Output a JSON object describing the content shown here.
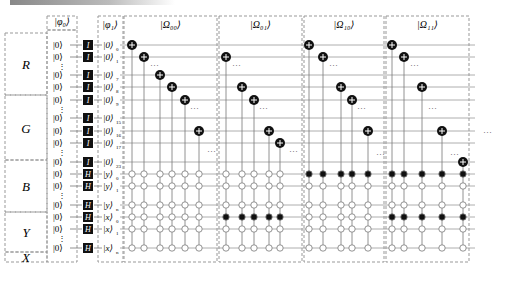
{
  "registers": [
    {
      "name": "R",
      "y0": 33,
      "y1": 95
    },
    {
      "name": "G",
      "y0": 95,
      "y1": 160
    },
    {
      "name": "B",
      "y0": 160,
      "y1": 212
    },
    {
      "name": "Y",
      "y0": 212,
      "y1": 252
    },
    {
      "name": "X",
      "y0": 252,
      "y1": 297
    }
  ],
  "input_header": "|φ₀⟩",
  "output_header": "|φ₁⟩",
  "rows": [
    {
      "id": "r0",
      "y": 45,
      "in": "|0⟩",
      "gate": "I",
      "out": "|0⟩",
      "sub": "0"
    },
    {
      "id": "r1",
      "y": 57,
      "in": "|0⟩",
      "gate": "I",
      "out": "|0⟩",
      "sub": "1"
    },
    {
      "id": "r7",
      "y": 75,
      "in": "|0⟩",
      "gate": "I",
      "out": "|0⟩",
      "sub": "7"
    },
    {
      "id": "r8",
      "y": 87,
      "in": "|0⟩",
      "gate": "I",
      "out": "|0⟩",
      "sub": "8"
    },
    {
      "id": "r9",
      "y": 100,
      "in": "|0⟩",
      "gate": "I",
      "out": "|0⟩",
      "sub": "9"
    },
    {
      "id": "r15",
      "y": 118,
      "in": "|0⟩",
      "gate": "I",
      "out": "|0⟩",
      "sub": "15"
    },
    {
      "id": "r16",
      "y": 131,
      "in": "|0⟩",
      "gate": "I",
      "out": "|0⟩",
      "sub": "16"
    },
    {
      "id": "r17",
      "y": 143,
      "in": "|0⟩",
      "gate": "I",
      "out": "|0⟩",
      "sub": "17"
    },
    {
      "id": "r23",
      "y": 162,
      "in": "|0⟩",
      "gate": "I",
      "out": "|0⟩",
      "sub": "23"
    },
    {
      "id": "y0",
      "y": 174,
      "in": "|0⟩",
      "gate": "H",
      "out": "|y⟩",
      "sub": "0"
    },
    {
      "id": "y1",
      "y": 186,
      "in": "|0⟩",
      "gate": "H",
      "out": "|y⟩",
      "sub": "1"
    },
    {
      "id": "yn",
      "y": 205,
      "in": "|0⟩",
      "gate": "H",
      "out": "|y⟩",
      "sub": "n"
    },
    {
      "id": "x0",
      "y": 217,
      "in": "|0⟩",
      "gate": "H",
      "out": "|x⟩",
      "sub": "0"
    },
    {
      "id": "x1",
      "y": 229,
      "in": "|0⟩",
      "gate": "H",
      "out": "|x⟩",
      "sub": "1"
    },
    {
      "id": "xn",
      "y": 248,
      "in": "|0⟩",
      "gate": "H",
      "out": "|x⟩",
      "sub": "n"
    }
  ],
  "vdots_input": [
    66,
    109,
    152,
    195,
    238
  ],
  "blocks": [
    {
      "label": "|Ω₀₀⟩",
      "x0": 123,
      "x1": 218,
      "targets": [
        [
          132,
          "r0"
        ],
        [
          144,
          "r1"
        ],
        [
          160,
          "r7"
        ],
        [
          172,
          "r8"
        ],
        [
          185,
          "r9"
        ],
        [
          199,
          "r16"
        ]
      ],
      "filled": [],
      "dots": [
        [
          150,
          66
        ],
        [
          190,
          109
        ],
        [
          207,
          152
        ]
      ]
    },
    {
      "label": "|Ω₀₁⟩",
      "x0": 218,
      "x1": 303,
      "targets": [
        [
          226,
          "r1"
        ],
        [
          242,
          "r8"
        ],
        [
          254,
          "r9"
        ],
        [
          269,
          "r16"
        ],
        [
          280,
          "r17"
        ]
      ],
      "filled": [
        "x0"
      ],
      "dots": [
        [
          232,
          66
        ],
        [
          259,
          109
        ],
        [
          289,
          152
        ]
      ]
    },
    {
      "label": "|Ω₁₀⟩",
      "x0": 303,
      "x1": 385,
      "targets": [
        [
          309,
          "r0"
        ],
        [
          323,
          "r1"
        ],
        [
          341,
          "r8"
        ],
        [
          352,
          "r9"
        ],
        [
          368,
          "r16"
        ]
      ],
      "filled": [
        "y0"
      ],
      "dots": [
        [
          329,
          66
        ],
        [
          357,
          109
        ],
        [
          376,
          155
        ]
      ]
    },
    {
      "label": "|Ω₁₁⟩",
      "x0": 385,
      "x1": 470,
      "targets": [
        [
          392,
          "r0"
        ],
        [
          404,
          "r1"
        ],
        [
          422,
          "r8"
        ],
        [
          442,
          "r16"
        ],
        [
          463,
          "r23"
        ]
      ],
      "filled": [
        "y0",
        "x0"
      ],
      "dots": [
        [
          410,
          66
        ],
        [
          428,
          109
        ],
        [
          450,
          155
        ],
        [
          483,
          133
        ]
      ]
    }
  ]
}
